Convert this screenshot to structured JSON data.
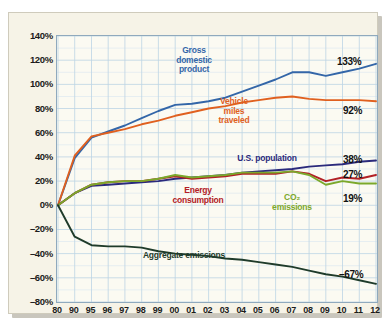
{
  "chart_data": {
    "type": "line",
    "title": "",
    "xlabel": "",
    "ylabel": "",
    "xlim": [
      0,
      19
    ],
    "ylim": [
      -80,
      140
    ],
    "grid": true,
    "legend_position": "inline-annotations",
    "categories": [
      "80",
      "90",
      "95",
      "96",
      "97",
      "98",
      "99",
      "00",
      "01",
      "02",
      "03",
      "04",
      "05",
      "06",
      "07",
      "08",
      "09",
      "10",
      "11",
      "12"
    ],
    "ytick_labels": [
      "140%",
      "120%",
      "100%",
      "80%",
      "60%",
      "40%",
      "20%",
      "0%",
      "-20%",
      "-40%",
      "-60%",
      "-80%"
    ],
    "ytick_values": [
      140,
      120,
      100,
      80,
      60,
      40,
      20,
      0,
      -20,
      -40,
      -60,
      -80
    ],
    "series": [
      {
        "name": "Gross domestic product",
        "color": "#3366a8",
        "end_label": "133%",
        "values": [
          0,
          39,
          56,
          61,
          66,
          72,
          78,
          83,
          84,
          86,
          89,
          94,
          99,
          104,
          110,
          110,
          107,
          110,
          113,
          117
        ]
      },
      {
        "name": "Vehicle miles traveled",
        "color": "#e0601f",
        "end_label": "92%",
        "values": [
          0,
          41,
          57,
          60,
          63,
          67,
          70,
          74,
          77,
          80,
          82,
          85,
          87,
          89,
          90,
          88,
          87,
          87,
          87,
          86
        ]
      },
      {
        "name": "U.S. population",
        "color": "#2b2a7c",
        "end_label": "38%",
        "values": [
          0,
          10,
          16,
          17,
          18,
          19,
          20,
          22,
          23,
          24,
          25,
          27,
          28,
          29,
          30,
          32,
          33,
          34,
          36,
          37
        ]
      },
      {
        "name": "Energy consumption",
        "color": "#b22025",
        "end_label": "27%",
        "values": [
          0,
          10,
          17,
          19,
          20,
          20,
          22,
          24,
          22,
          23,
          24,
          26,
          26,
          26,
          28,
          26,
          20,
          23,
          22,
          25
        ]
      },
      {
        "name": "CO2 emissions",
        "color": "#7ba82b",
        "end_label": "19%",
        "values": [
          0,
          10,
          17,
          19,
          20,
          20,
          22,
          25,
          23,
          24,
          25,
          27,
          27,
          27,
          28,
          25,
          17,
          20,
          18,
          18
        ]
      },
      {
        "name": "Aggregate emissions",
        "color": "#1f3b2a",
        "end_label": "-67%",
        "values": [
          0,
          -26,
          -33,
          -34,
          -34,
          -35,
          -38,
          -40,
          -41,
          -42,
          -44,
          -45,
          -47,
          -49,
          -51,
          -54,
          -57,
          -59,
          -62,
          -65
        ]
      }
    ],
    "annotations": [
      {
        "name": "gross-domestic-product",
        "lines": [
          "Gross",
          "domestic",
          "product"
        ],
        "color": "#3366a8",
        "x": 185,
        "y": 33
      },
      {
        "name": "vehicle-miles-traveled",
        "lines": [
          "Vehicle",
          "miles",
          "traveled"
        ],
        "color": "#e0601f",
        "x": 225,
        "y": 84
      },
      {
        "name": "us-population",
        "lines": [
          "U.S. population"
        ],
        "color": "#2b2a7c",
        "x": 258,
        "y": 141
      },
      {
        "name": "energy-consumption",
        "lines": [
          "Energy",
          "consumption"
        ],
        "color": "#b22025",
        "x": 189,
        "y": 173
      },
      {
        "name": "co2-emissions",
        "lines": [
          "CO₂",
          "emissions"
        ],
        "color": "#7ba82b",
        "x": 283,
        "y": 180
      },
      {
        "name": "aggregate-emissions",
        "lines": [
          "Aggregate emissions"
        ],
        "color": "#1f3b2a",
        "x": 175,
        "y": 238
      }
    ],
    "end_labels": [
      {
        "name": "gdp-end-label",
        "text": "133%",
        "x": 328,
        "y": 43
      },
      {
        "name": "vmt-end-label",
        "text": "92%",
        "x": 334,
        "y": 92
      },
      {
        "name": "population-end-label",
        "text": "38%",
        "x": 334,
        "y": 141
      },
      {
        "name": "energy-end-label",
        "text": "27%",
        "x": 334,
        "y": 156
      },
      {
        "name": "co2-end-label",
        "text": "19%",
        "x": 334,
        "y": 180
      },
      {
        "name": "aggregate-end-label",
        "text": "-67%",
        "x": 330,
        "y": 256
      }
    ],
    "colors": {
      "panel_background": "#f6f3e7",
      "plot_background": "#fbfaf2",
      "gridline": "#bcd4e4",
      "axis_border": "#8fa9bd",
      "gdp": "#3366a8",
      "vmt": "#e0601f",
      "population": "#2b2a7c",
      "energy": "#b22025",
      "co2": "#7ba82b",
      "aggregate": "#1f3b2a"
    }
  }
}
